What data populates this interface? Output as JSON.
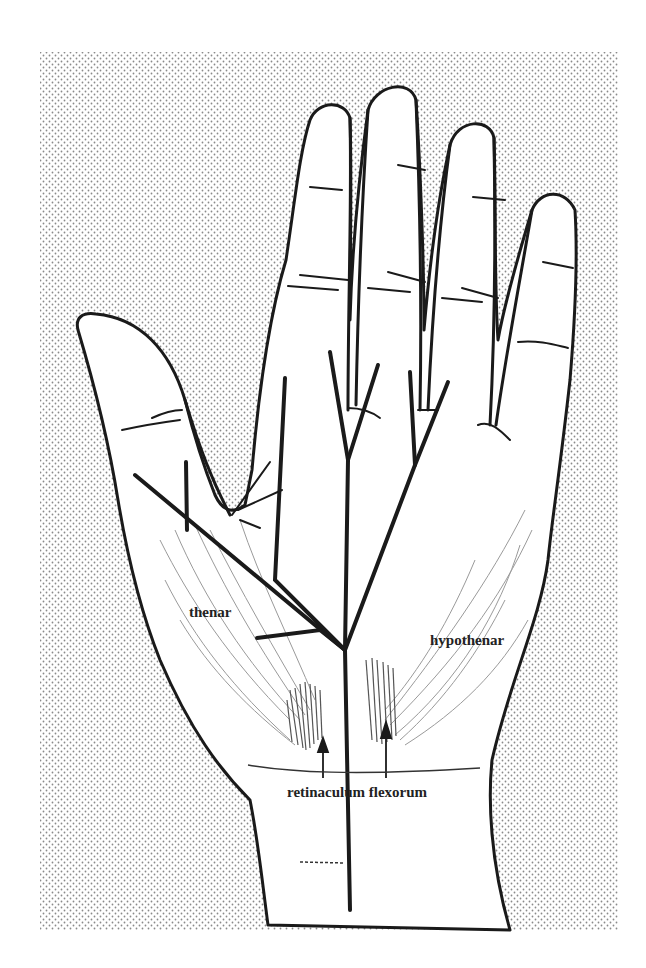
{
  "figure": {
    "labels": {
      "thenar": "thenar",
      "hypothenar": "hypothenar",
      "retinaculum": "retinaculum flexorum"
    },
    "colors": {
      "background": "#ffffff",
      "stipple_dot": "#8a8a8a",
      "outline": "#1a1a1a",
      "muscle_fibers": "#9a9a9a"
    }
  }
}
